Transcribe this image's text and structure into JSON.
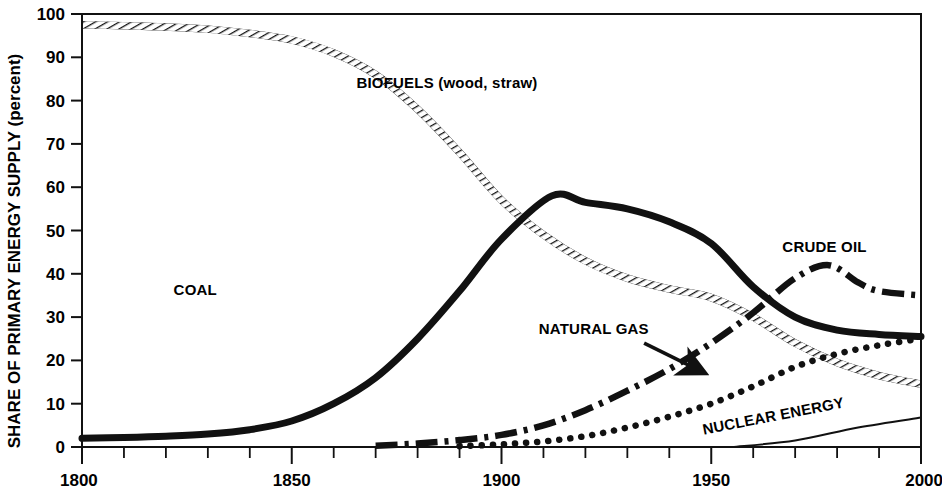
{
  "chart_data": {
    "type": "line",
    "title": "",
    "xlabel": "",
    "ylabel": "SHARE OF PRIMARY ENERGY SUPPLY (percent)",
    "xlim": [
      1800,
      2000
    ],
    "ylim": [
      0,
      100
    ],
    "grid": false,
    "legend_position": "inline-annotations",
    "x_tick_labels": [
      "1800",
      "1850",
      "1900",
      "1950",
      "2000"
    ],
    "x_tick_values": [
      1800,
      1850,
      1900,
      1950,
      2000
    ],
    "x_minor_tick_step": 10,
    "y_tick_labels": [
      "0",
      "10",
      "20",
      "30",
      "40",
      "50",
      "60",
      "70",
      "80",
      "90",
      "100"
    ],
    "y_tick_values": [
      0,
      10,
      20,
      30,
      40,
      50,
      60,
      70,
      80,
      90,
      100
    ],
    "series": [
      {
        "name": "BIOFUELS (wood, straw)",
        "label": "BIOFUELS (wood, straw)",
        "style": "hatched",
        "color": "#1a1a1a",
        "x": [
          1800,
          1810,
          1820,
          1830,
          1840,
          1850,
          1860,
          1870,
          1880,
          1890,
          1900,
          1910,
          1920,
          1930,
          1940,
          1950,
          1960,
          1970,
          1980,
          1990,
          2000
        ],
        "values": [
          97.5,
          97.3,
          97.0,
          96.5,
          95.5,
          94.0,
          91.0,
          86.0,
          78.0,
          68.0,
          57.0,
          49.0,
          43.0,
          39.0,
          36.5,
          34.5,
          30.0,
          24.0,
          19.5,
          16.5,
          14.5
        ]
      },
      {
        "name": "COAL",
        "label": "COAL",
        "style": "thick-solid",
        "color": "#111111",
        "x": [
          1800,
          1810,
          1820,
          1830,
          1840,
          1850,
          1860,
          1870,
          1880,
          1890,
          1900,
          1912,
          1920,
          1930,
          1940,
          1950,
          1960,
          1970,
          1980,
          1990,
          2000
        ],
        "values": [
          2.0,
          2.2,
          2.5,
          3.0,
          4.0,
          6.0,
          10.0,
          16.0,
          25.0,
          36.0,
          48.0,
          58.0,
          56.5,
          55.0,
          52.0,
          47.0,
          37.0,
          30.0,
          27.0,
          26.0,
          25.5
        ]
      },
      {
        "name": "CRUDE OIL",
        "label": "CRUDE OIL",
        "style": "dash-dot",
        "color": "#111111",
        "x": [
          1870,
          1880,
          1890,
          1900,
          1910,
          1920,
          1930,
          1940,
          1950,
          1960,
          1970,
          1978,
          1985,
          1990,
          2000
        ],
        "values": [
          0.3,
          0.8,
          1.6,
          2.8,
          5.0,
          8.5,
          13.0,
          18.0,
          24.0,
          31.0,
          39.0,
          42.0,
          38.0,
          36.0,
          35.0
        ]
      },
      {
        "name": "NATURAL GAS",
        "label": "NATURAL GAS",
        "style": "dotted",
        "color": "#111111",
        "x": [
          1890,
          1900,
          1910,
          1920,
          1930,
          1940,
          1950,
          1960,
          1970,
          1980,
          1990,
          2000
        ],
        "values": [
          0.2,
          0.6,
          1.3,
          2.5,
          4.5,
          7.0,
          10.0,
          14.0,
          18.5,
          21.5,
          23.5,
          25.0
        ]
      },
      {
        "name": "NUCLEAR ENERGY",
        "label": "NUCLEAR ENERGY",
        "style": "thin-solid",
        "color": "#111111",
        "x": [
          1955,
          1970,
          1985,
          2000
        ],
        "values": [
          0.0,
          1.5,
          4.5,
          6.8
        ]
      }
    ],
    "annotations": [
      {
        "text": "BIOFUELS (wood, straw)",
        "x": 1887,
        "y": 83,
        "rotation": 0
      },
      {
        "text": "COAL",
        "x": 1827,
        "y": 35,
        "rotation": 0
      },
      {
        "text": "NATURAL GAS",
        "x": 1922,
        "y": 26,
        "rotation": 0
      },
      {
        "text": "CRUDE OIL",
        "x": 1977,
        "y": 45,
        "rotation": 0
      },
      {
        "text": "NUCLEAR ENERGY",
        "x": 1965,
        "y": 6,
        "rotation": -11
      },
      {
        "text": "arrow",
        "x": 1940,
        "y": 20,
        "rotation": 0
      }
    ]
  },
  "axis": {
    "y_title": "SHARE OF PRIMARY ENERGY SUPPLY (percent)",
    "ticks_y": [
      "100",
      "90",
      "80",
      "70",
      "60",
      "50",
      "40",
      "30",
      "20",
      "10",
      "0"
    ],
    "ticks_x": [
      "1800",
      "1850",
      "1900",
      "1950",
      "2000"
    ]
  },
  "labels": {
    "biofuels": "BIOFUELS (wood, straw)",
    "coal": "COAL",
    "natural_gas": "NATURAL GAS",
    "crude_oil": "CRUDE OIL",
    "nuclear": "NUCLEAR ENERGY"
  },
  "colors": {
    "ink": "#111111",
    "background": "#ffffff"
  }
}
